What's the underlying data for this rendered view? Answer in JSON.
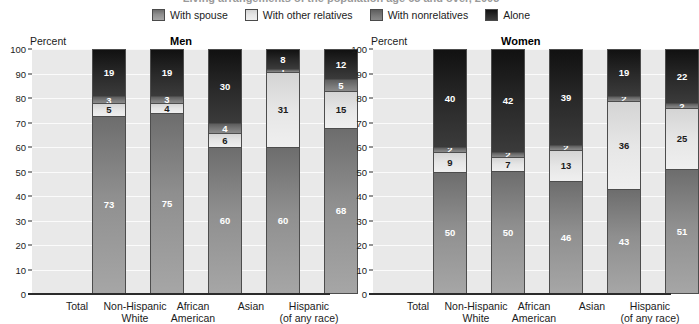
{
  "top_title": "Living arrangements of the population age 65 and over, 2003",
  "legend": {
    "items": [
      {
        "label": "With spouse",
        "key": "spouse",
        "color": "#8f8f8f"
      },
      {
        "label": "With other relatives",
        "key": "other",
        "color": "#e6e6e6"
      },
      {
        "label": "With nonrelatives",
        "key": "nonrel",
        "color": "#7b7b7b"
      },
      {
        "label": "Alone",
        "key": "alone",
        "color": "#2a2a2a"
      }
    ]
  },
  "axis": {
    "title": "Percent",
    "ticks": [
      "100",
      "90",
      "80",
      "70",
      "60",
      "50",
      "40",
      "30",
      "20",
      "10",
      "0"
    ],
    "min": 0,
    "max": 100
  },
  "panels": [
    {
      "id": "men",
      "title": "Men",
      "categories": [
        {
          "line1": "Total",
          "line2": ""
        },
        {
          "line1": "Non-Hispanic",
          "line2": "White"
        },
        {
          "line1": "African",
          "line2": "American"
        },
        {
          "line1": "Asian",
          "line2": ""
        },
        {
          "line1": "Hispanic",
          "line2": "(of any race)"
        }
      ]
    },
    {
      "id": "women",
      "title": "Women",
      "categories": [
        {
          "line1": "Total",
          "line2": ""
        },
        {
          "line1": "Non-Hispanic",
          "line2": "White"
        },
        {
          "line1": "African",
          "line2": "American"
        },
        {
          "line1": "Asian",
          "line2": ""
        },
        {
          "line1": "Hispanic",
          "line2": "(of any race)"
        }
      ]
    }
  ],
  "chart_data": [
    {
      "type": "bar",
      "title": "Men",
      "stacked": true,
      "xlabel": "",
      "ylabel": "Percent",
      "ylim": [
        0,
        100
      ],
      "grid": true,
      "legend_position": "top-center",
      "categories": [
        "Total",
        "Non-Hispanic White",
        "African American",
        "Asian",
        "Hispanic (of any race)"
      ],
      "series": [
        {
          "name": "With spouse",
          "values": [
            73,
            75,
            60,
            60,
            68
          ],
          "labels": [
            "73",
            "75",
            "60",
            "60",
            "68"
          ]
        },
        {
          "name": "With other relatives",
          "values": [
            5,
            4,
            6,
            31,
            15
          ],
          "labels": [
            "5",
            "4",
            "6",
            "31",
            "15"
          ]
        },
        {
          "name": "With nonrelatives",
          "values": [
            3,
            3,
            4,
            1,
            5
          ],
          "labels": [
            "3",
            "3",
            "4",
            "1",
            "5"
          ]
        },
        {
          "name": "Alone",
          "values": [
            19,
            19,
            30,
            8,
            12
          ],
          "labels": [
            "19",
            "19",
            "30",
            "8",
            "12"
          ]
        }
      ]
    },
    {
      "type": "bar",
      "title": "Women",
      "stacked": true,
      "xlabel": "",
      "ylabel": "Percent",
      "ylim": [
        0,
        100
      ],
      "grid": true,
      "legend_position": "top-center",
      "categories": [
        "Total",
        "Non-Hispanic White",
        "African American",
        "Asian",
        "Hispanic (of any race)"
      ],
      "series": [
        {
          "name": "With spouse",
          "values": [
            50,
            50,
            46,
            43,
            51
          ],
          "labels": [
            "50",
            "50",
            "46",
            "43",
            "51"
          ]
        },
        {
          "name": "With other relatives",
          "values": [
            8,
            6,
            13,
            36,
            25
          ],
          "labels": [
            "9",
            "7",
            "13",
            "36",
            "25"
          ]
        },
        {
          "name": "With nonrelatives",
          "values": [
            2,
            2,
            2,
            2,
            2
          ],
          "labels": [
            "2",
            "2",
            "2",
            "2",
            "2"
          ]
        },
        {
          "name": "Alone",
          "values": [
            40,
            42,
            39,
            19,
            22
          ],
          "labels": [
            "40",
            "42",
            "39",
            "19",
            "22"
          ]
        }
      ]
    }
  ]
}
